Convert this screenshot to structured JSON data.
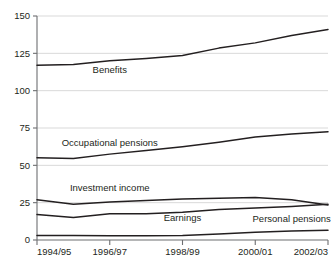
{
  "chart_data": {
    "type": "line",
    "title": "",
    "subtitle": "",
    "xlabel": "",
    "ylabel": "",
    "ylim": [
      0,
      150
    ],
    "yticks": [
      0,
      25,
      50,
      75,
      100,
      125,
      150
    ],
    "grid": true,
    "legend_position": "inline-labels",
    "x": [
      "1994/95",
      "1995/96",
      "1996/97",
      "1997/98",
      "1998/99",
      "1999/00",
      "2000/01",
      "2001/02",
      "2002/03"
    ],
    "xtick_labels": [
      "1994/95",
      "1996/97",
      "1998/99",
      "2000/01",
      "2002/03"
    ],
    "series": [
      {
        "name": "Benefits",
        "values": [
          117,
          117.5,
          120,
          121.5,
          123.5,
          128.5,
          132,
          137,
          141
        ],
        "label_x": "1996/97",
        "label_value": 112
      },
      {
        "name": "Occupational pensions",
        "values": [
          55,
          54.5,
          57.5,
          60,
          62.5,
          65.5,
          69,
          71,
          72.5
        ],
        "label_x": "1996/97",
        "label_value": 63
      },
      {
        "name": "Investment income",
        "values": [
          27,
          24,
          25.5,
          26.5,
          27.5,
          28,
          28.5,
          27,
          23.5
        ],
        "label_x": "1996/97",
        "label_value": 33
      },
      {
        "name": "Earnings",
        "values": [
          17,
          15,
          17.5,
          17.5,
          18.5,
          20.5,
          21.5,
          22.5,
          24
        ],
        "label_x": "1998/99",
        "label_value": 13
      },
      {
        "name": "Personal pensions",
        "values": [
          3,
          3,
          2.8,
          2.8,
          3,
          4,
          5.2,
          6,
          6.5
        ],
        "label_x": "2001/02",
        "label_value": 12
      }
    ]
  }
}
